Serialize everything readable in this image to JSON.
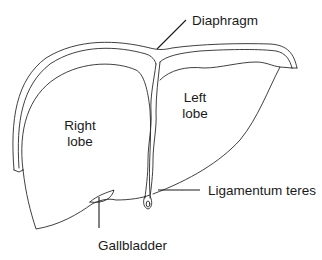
{
  "diagram": {
    "labels": {
      "diaphragm": "Diaphragm",
      "right_lobe_line1": "Right",
      "right_lobe_line2": "lobe",
      "left_lobe_line1": "Left",
      "left_lobe_line2": "lobe",
      "ligamentum_teres": "Ligamentum teres",
      "gallbladder": "Gallbladder"
    },
    "colors": {
      "line": "#2a2a2a",
      "background": "#ffffff",
      "text": "#1a1a1a"
    }
  }
}
